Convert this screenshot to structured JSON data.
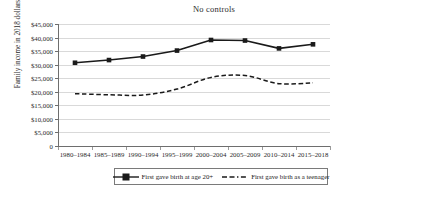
{
  "chart_data": {
    "type": "line",
    "title": "No controls",
    "xlabel": "",
    "ylabel": "Family income in 2018 dollars",
    "categories": [
      "1980–1984",
      "1985–1989",
      "1990–1994",
      "1995–1999",
      "2000–2004",
      "2005–2009",
      "2010–2014",
      "2015–2018"
    ],
    "ylim": [
      0,
      45000
    ],
    "ytick_values": [
      0,
      5000,
      10000,
      15000,
      20000,
      25000,
      30000,
      35000,
      40000,
      45000
    ],
    "ytick_labels": [
      "0",
      "$5,000",
      "$10,000",
      "$15,000",
      "$20,000",
      "$25,000",
      "$30,000",
      "$35,000",
      "$40,000",
      "$45,000"
    ],
    "grid": true,
    "legend_position": "bottom",
    "series": [
      {
        "name": "First gave birth at age 20+",
        "style": "solid",
        "marker": "square",
        "color": "#1a1a1a",
        "values": [
          30700,
          31700,
          33000,
          35200,
          39100,
          38900,
          36000,
          37500
        ]
      },
      {
        "name": "First gave birth as a teenager",
        "style": "dashed",
        "marker": "none",
        "color": "#1a1a1a",
        "values": [
          19300,
          18900,
          18800,
          21000,
          25300,
          26000,
          23000,
          23300
        ]
      }
    ]
  },
  "axis": {
    "line_color": "#6e6e6e",
    "grid_color": "#d9d9d9"
  }
}
